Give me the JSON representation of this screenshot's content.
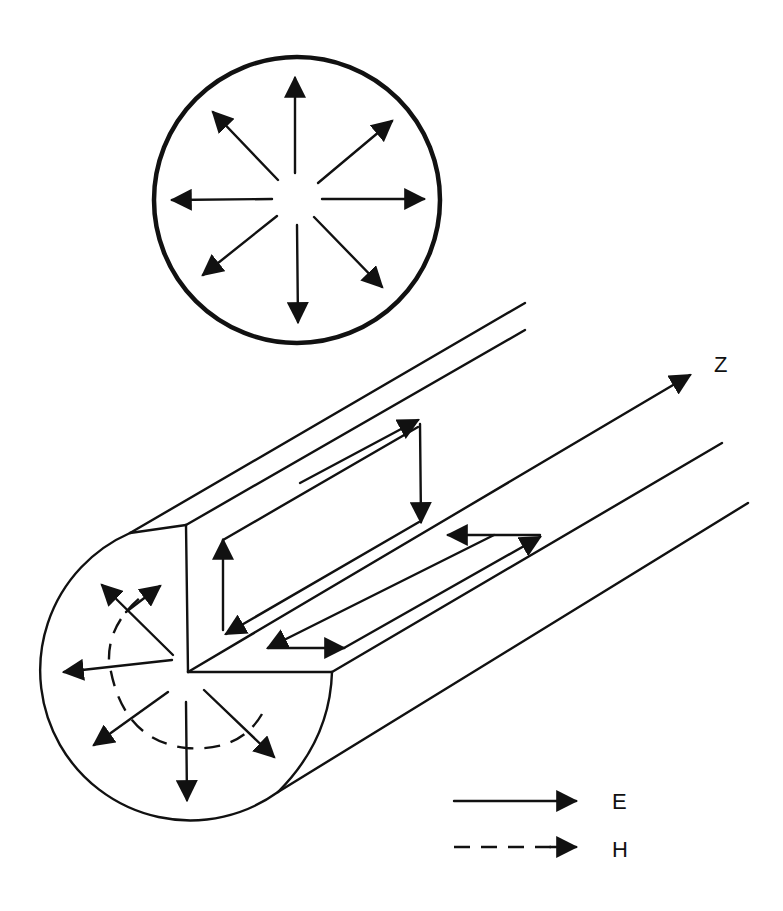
{
  "diagram": {
    "type": "cylindrical waveguide field pattern (TM01-like)",
    "axis_label": "Z",
    "cross_section": {
      "description": "Circular cross-section with radial E-field arrows",
      "radial_arrow_count": 8
    },
    "cutaway": {
      "description": "Cylindrical guide with quarter cutaway; radial E arrows and dashed circular H line on end face, closed E loops on longitudinal cut faces"
    },
    "legend": [
      {
        "style": "solid",
        "label": "E",
        "color": "#111111"
      },
      {
        "style": "dashed",
        "label": "H",
        "color": "#111111"
      }
    ],
    "colors": {
      "ink": "#111111",
      "background": "#ffffff"
    }
  }
}
